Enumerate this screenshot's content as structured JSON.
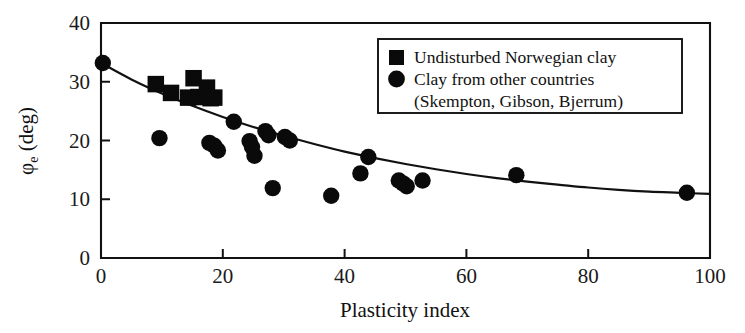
{
  "figure": {
    "width": 745,
    "height": 333,
    "background": "#ffffff",
    "ink_color": "#111111"
  },
  "axes": {
    "x_title": "Plasticity index",
    "y_title_main": "φ",
    "y_title_sub": "e",
    "y_title_unit": " (deg)",
    "x_ticks": [
      "0",
      "20",
      "40",
      "60",
      "80",
      "100"
    ],
    "y_ticks": [
      "0",
      "10",
      "20",
      "30",
      "40"
    ]
  },
  "legend": {
    "entries": [
      {
        "marker": "square",
        "label": "Undisturbed Norwegian clay"
      },
      {
        "marker": "circle",
        "label": "Clay from other countries"
      }
    ],
    "continuation_line": "(Skempton, Gibson, Bjerrum)"
  },
  "chart_data": {
    "type": "scatter",
    "title": "",
    "xlabel": "Plasticity index",
    "ylabel": "φe (deg)",
    "xlim": [
      0,
      100
    ],
    "ylim": [
      0,
      40
    ],
    "xticks": [
      0,
      20,
      40,
      60,
      80,
      100
    ],
    "yticks": [
      0,
      10,
      20,
      30,
      40
    ],
    "grid": false,
    "legend_position": "upper right",
    "series": [
      {
        "name": "Undisturbed Norwegian clay",
        "marker": "square",
        "color": "#0a0a0a",
        "points": [
          [
            9.0,
            29.6
          ],
          [
            11.5,
            28.1
          ],
          [
            14.3,
            27.3
          ],
          [
            15.2,
            30.6
          ],
          [
            16.0,
            27.4
          ],
          [
            17.4,
            29.0
          ],
          [
            18.0,
            27.2
          ],
          [
            18.6,
            27.3
          ]
        ]
      },
      {
        "name": "Clay from other countries",
        "marker": "circle",
        "color": "#0a0a0a",
        "points": [
          [
            0.3,
            33.2
          ],
          [
            9.6,
            20.4
          ],
          [
            17.8,
            19.6
          ],
          [
            18.6,
            19.1
          ],
          [
            19.2,
            18.3
          ],
          [
            21.8,
            23.2
          ],
          [
            24.4,
            19.9
          ],
          [
            24.8,
            18.9
          ],
          [
            25.2,
            17.4
          ],
          [
            27.0,
            21.6
          ],
          [
            27.5,
            20.9
          ],
          [
            28.2,
            11.9
          ],
          [
            30.2,
            20.6
          ],
          [
            31.0,
            20.0
          ],
          [
            37.8,
            10.6
          ],
          [
            42.6,
            14.4
          ],
          [
            43.9,
            17.2
          ],
          [
            48.9,
            13.2
          ],
          [
            49.6,
            12.7
          ],
          [
            50.2,
            12.2
          ],
          [
            52.8,
            13.2
          ],
          [
            68.2,
            14.1
          ],
          [
            96.2,
            11.1
          ]
        ]
      },
      {
        "name": "Fitted trend curve",
        "marker": "line",
        "color": "#111111",
        "points": [
          [
            0,
            33.2
          ],
          [
            5,
            30.4
          ],
          [
            10,
            28.0
          ],
          [
            15,
            25.9
          ],
          [
            20,
            24.0
          ],
          [
            25,
            22.3
          ],
          [
            30,
            20.8
          ],
          [
            35,
            19.4
          ],
          [
            40,
            18.1
          ],
          [
            45,
            17.0
          ],
          [
            50,
            16.0
          ],
          [
            55,
            15.1
          ],
          [
            60,
            14.3
          ],
          [
            65,
            13.6
          ],
          [
            70,
            13.0
          ],
          [
            75,
            12.5
          ],
          [
            80,
            12.0
          ],
          [
            85,
            11.6
          ],
          [
            90,
            11.3
          ],
          [
            95,
            11.1
          ],
          [
            100,
            10.9
          ]
        ]
      }
    ]
  }
}
